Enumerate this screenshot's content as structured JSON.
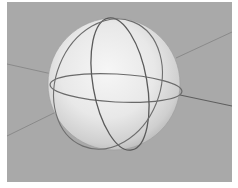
{
  "scene": {
    "description": "3D rendered translucent sphere with three great circles and axis lines",
    "background_color": "#a9a9a9",
    "sphere": {
      "cx": 114,
      "cy": 84,
      "r": 66,
      "highlight": "#f4f4f4",
      "shade": "#bdbdbd"
    },
    "great_circles": [
      {
        "name": "equator",
        "rx": 66,
        "ry": 14,
        "rotate": 3
      },
      {
        "name": "meridian-front",
        "rx": 26,
        "ry": 67,
        "rotate": -12
      },
      {
        "name": "meridian-side",
        "rx": 46,
        "ry": 67,
        "rotate": 18
      }
    ],
    "line_color": "#5a5a5a"
  }
}
